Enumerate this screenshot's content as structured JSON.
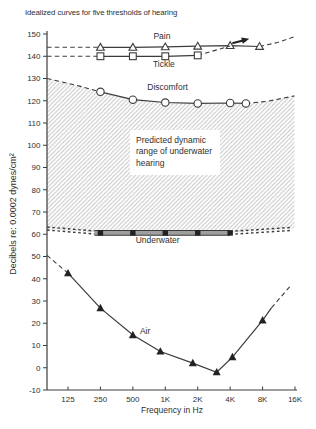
{
  "colors": {
    "line": "#3c3c3c",
    "text": "#2f2f2f",
    "hatch": "#c4c4c4",
    "band_fill": "#9e9e9e",
    "marker_fill": "#ffffff",
    "filled_marker": "#222222",
    "background": "#ffffff"
  },
  "chart_data": {
    "type": "line",
    "title": "Idealized curves for five thresholds of hearing",
    "xlabel": "Frequency in Hz",
    "ylabel": "Decibels re: 0.0002 dynes/cm²",
    "x_scale": "log2",
    "ylim": [
      -10,
      150
    ],
    "y_tick_step": 10,
    "x_ticks": [
      {
        "f": 125,
        "label": "125"
      },
      {
        "f": 250,
        "label": "250"
      },
      {
        "f": 500,
        "label": "500"
      },
      {
        "f": 1000,
        "label": "1K"
      },
      {
        "f": 2000,
        "label": "2K"
      },
      {
        "f": 4000,
        "label": "4K"
      },
      {
        "f": 8000,
        "label": "8K"
      },
      {
        "f": 16000,
        "label": "16K"
      }
    ],
    "series": [
      {
        "name": "Pain",
        "style": "line",
        "marker": "triangle-open",
        "dash_left": [
          [
            80,
            144
          ],
          [
            250,
            144
          ]
        ],
        "solid": [
          [
            250,
            144
          ],
          [
            500,
            144
          ],
          [
            1000,
            144.2
          ],
          [
            2000,
            144.5
          ],
          [
            4000,
            144.8
          ],
          [
            7500,
            144.4
          ]
        ],
        "dash_right": [
          [
            7500,
            144.4
          ],
          [
            11000,
            146.2
          ],
          [
            15500,
            148.6
          ]
        ],
        "label": {
          "text": "Pain",
          "f": 930,
          "v": 149.1
        }
      },
      {
        "name": "Tickle",
        "style": "line",
        "marker": "square-open",
        "dash_left": [
          [
            80,
            140
          ],
          [
            250,
            140
          ]
        ],
        "solid": [
          [
            250,
            140
          ],
          [
            500,
            140
          ],
          [
            1000,
            140
          ],
          [
            2000,
            140.4
          ]
        ],
        "dash_right": [
          [
            2000,
            140.4
          ],
          [
            4000,
            144.6
          ]
        ],
        "label": {
          "text": "Tickle",
          "f": 970,
          "v": 136.3
        }
      },
      {
        "name": "Discomfort",
        "style": "line",
        "marker": "circle-open",
        "dash_left": [
          [
            80,
            130
          ],
          [
            160,
            126.6
          ],
          [
            250,
            124
          ]
        ],
        "solid": [
          [
            250,
            124
          ],
          [
            500,
            120.5
          ],
          [
            1000,
            119.2
          ],
          [
            2000,
            118.8
          ],
          [
            4000,
            119
          ],
          [
            5600,
            118.8
          ]
        ],
        "dash_right": [
          [
            5600,
            118.8
          ],
          [
            9000,
            119.8
          ],
          [
            15800,
            122.2
          ]
        ],
        "label": {
          "text": "Discomfort",
          "f": 1050,
          "v": 126.2
        }
      },
      {
        "name": "Underwater",
        "style": "band",
        "marker": "square-filled",
        "dash_left": [
          [
            80,
            62.6
          ],
          [
            220,
            60.8
          ]
        ],
        "solid": [
          [
            220,
            60.6
          ],
          [
            4000,
            60.6
          ]
        ],
        "marker_points": [
          [
            250,
            60.6
          ],
          [
            500,
            60.6
          ],
          [
            1000,
            60.6
          ],
          [
            2000,
            60.6
          ],
          [
            4000,
            60.6
          ]
        ],
        "dash_right": [
          [
            4000,
            60.6
          ],
          [
            15000,
            62.4
          ]
        ],
        "label": {
          "text": "Underwater",
          "f": 850,
          "v": 57.2
        }
      },
      {
        "name": "Air",
        "style": "line",
        "marker": "triangle-filled",
        "dash_left": [
          [
            80,
            50.5
          ],
          [
            125,
            42.5
          ]
        ],
        "solid": [
          [
            125,
            42.5
          ],
          [
            250,
            26.8
          ],
          [
            500,
            14.7
          ],
          [
            900,
            7.3
          ],
          [
            1800,
            2.1
          ],
          [
            3000,
            -2
          ],
          [
            4200,
            4.8
          ],
          [
            8000,
            21.3
          ],
          [
            9700,
            27
          ]
        ],
        "marker_points": [
          [
            125,
            42.5
          ],
          [
            250,
            26.8
          ],
          [
            500,
            14.7
          ],
          [
            900,
            7.3
          ],
          [
            1800,
            2.1
          ],
          [
            3000,
            -2
          ],
          [
            4200,
            4.8
          ],
          [
            8000,
            21.3
          ]
        ],
        "dash_right": [
          [
            9700,
            27
          ],
          [
            14500,
            36.8
          ]
        ],
        "label": {
          "text": "Air",
          "f": 650,
          "v": 16.5
        }
      }
    ],
    "hatch_region": {
      "top": [
        [
          80,
          130
        ],
        [
          160,
          126.6
        ],
        [
          250,
          124
        ],
        [
          500,
          120.5
        ],
        [
          1000,
          119.2
        ],
        [
          2000,
          118.8
        ],
        [
          4000,
          119
        ],
        [
          5600,
          118.8
        ],
        [
          9000,
          119.8
        ],
        [
          15800,
          122.2
        ]
      ],
      "bottom": [
        [
          80,
          62.4
        ],
        [
          220,
          60.8
        ],
        [
          4000,
          60.6
        ],
        [
          15800,
          62.6
        ]
      ]
    },
    "annotation": {
      "lines": [
        "Predicted dynamic",
        "range of underwater",
        "hearing"
      ],
      "x": 130,
      "y": 130,
      "w": 90,
      "h": 45
    },
    "arrow": {
      "f": 5150,
      "v": 147,
      "angle_deg": -15
    }
  }
}
